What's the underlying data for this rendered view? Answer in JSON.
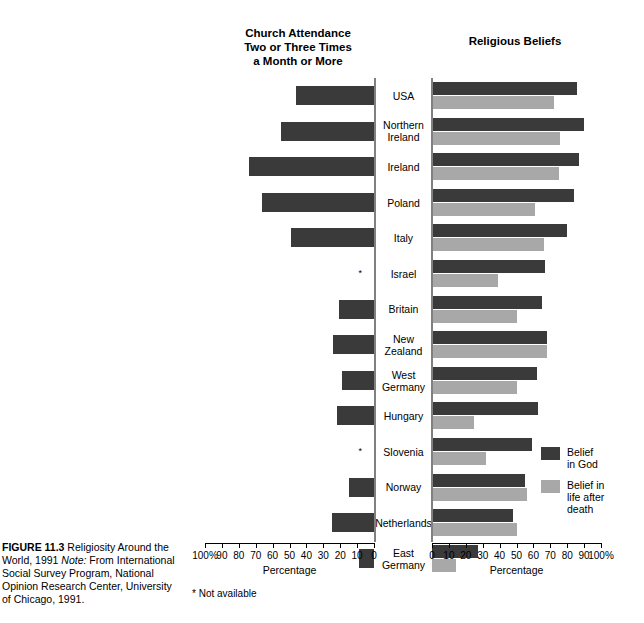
{
  "figure": {
    "caption_label": "FIGURE 11.3",
    "caption_title": " Religiosity Around the World, 1991 ",
    "caption_note_label": "Note:",
    "caption_note_text": " From International Social Survey Program, National Opinion Research Center, University of Chicago, 1991.",
    "footnote": "* Not available"
  },
  "left_panel": {
    "title": "Church Attendance\nTwo or Three Times\na Month or More",
    "axis_caption": "Percentage",
    "tick_labels": [
      "100%",
      "90",
      "80",
      "70",
      "60",
      "50",
      "40",
      "30",
      "20",
      "10",
      "0"
    ],
    "na_marker": "*"
  },
  "right_panel": {
    "title": "Religious Beliefs",
    "axis_caption": "Percentage",
    "tick_labels": [
      "0",
      "10",
      "20",
      "30",
      "40",
      "50",
      "60",
      "70",
      "80",
      "90",
      "100%"
    ]
  },
  "legend": {
    "items": [
      {
        "label": "Belief\nin God",
        "color": "#3a3a3a",
        "name": "belief-in-god"
      },
      {
        "label": "Belief in\nlife after\ndeath",
        "color": "#a8a8a8",
        "name": "belief-in-life-after-death"
      }
    ]
  },
  "colors": {
    "god": "#3a3a3a",
    "life_after_death": "#a8a8a8",
    "attendance": "#3a3a3a",
    "spine": "#808080"
  },
  "chart_data": {
    "type": "bar",
    "title": "Religiosity Around the World, 1991",
    "orientation": "horizontal",
    "layout": "back-to-back bidirectional (population pyramid style)",
    "categories": [
      "USA",
      "Northern Ireland",
      "Ireland",
      "Poland",
      "Italy",
      "Israel",
      "Britain",
      "New Zealand",
      "West Germany",
      "Hungary",
      "Slovenia",
      "Norway",
      "Netherlands",
      "East Germany"
    ],
    "panels": [
      {
        "name": "Church Attendance Two or Three Times a Month or More",
        "side": "left",
        "xlabel": "Percentage",
        "xlim": [
          100,
          0
        ],
        "direction": "right-to-left",
        "ticks": [
          100,
          90,
          80,
          70,
          60,
          50,
          40,
          30,
          20,
          10,
          0
        ],
        "series": [
          {
            "name": "Church attendance",
            "color": "#3a3a3a",
            "values": [
              46,
              55,
              74,
              66,
              49,
              null,
              21,
              24,
              19,
              22,
              null,
              15,
              25,
              9
            ]
          }
        ],
        "missing_note": "* Not available (Israel, Slovenia)"
      },
      {
        "name": "Religious Beliefs",
        "side": "right",
        "xlabel": "Percentage",
        "xlim": [
          0,
          100
        ],
        "direction": "left-to-right",
        "ticks": [
          0,
          10,
          20,
          30,
          40,
          50,
          60,
          70,
          80,
          90,
          100
        ],
        "series": [
          {
            "name": "Belief in God",
            "color": "#3a3a3a",
            "values": [
              86,
              90,
              87,
              84,
              80,
              67,
              65,
              68,
              62,
              63,
              59,
              55,
              48,
              27
            ]
          },
          {
            "name": "Belief in life after death",
            "color": "#a8a8a8",
            "values": [
              72,
              76,
              75,
              61,
              66,
              39,
              50,
              68,
              50,
              25,
              32,
              56,
              50,
              14
            ]
          }
        ]
      }
    ],
    "grid": false,
    "legend_position": "right-bottom"
  },
  "rows": [
    {
      "country": "USA",
      "attendance": 46,
      "god": 86,
      "life": 72
    },
    {
      "country": "Northern\nIreland",
      "attendance": 55,
      "god": 90,
      "life": 76
    },
    {
      "country": "Ireland",
      "attendance": 74,
      "god": 87,
      "life": 75
    },
    {
      "country": "Poland",
      "attendance": 66,
      "god": 84,
      "life": 61
    },
    {
      "country": "Italy",
      "attendance": 49,
      "god": 80,
      "life": 66
    },
    {
      "country": "Israel",
      "attendance": null,
      "god": 67,
      "life": 39
    },
    {
      "country": "Britain",
      "attendance": 21,
      "god": 65,
      "life": 50
    },
    {
      "country": "New Zealand",
      "attendance": 24,
      "god": 68,
      "life": 68
    },
    {
      "country": "West\nGermany",
      "attendance": 19,
      "god": 62,
      "life": 50
    },
    {
      "country": "Hungary",
      "attendance": 22,
      "god": 63,
      "life": 25
    },
    {
      "country": "Slovenia",
      "attendance": null,
      "god": 59,
      "life": 32
    },
    {
      "country": "Norway",
      "attendance": 15,
      "god": 55,
      "life": 56
    },
    {
      "country": "Netherlands",
      "attendance": 25,
      "god": 48,
      "life": 50
    },
    {
      "country": "East\nGermany",
      "attendance": 9,
      "god": 27,
      "life": 14
    }
  ]
}
